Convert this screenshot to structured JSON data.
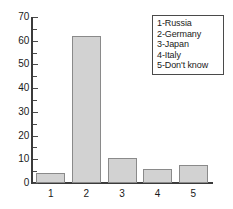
{
  "chart_data": {
    "type": "bar",
    "title": "",
    "xlabel": "",
    "ylabel": "",
    "categories": [
      "1",
      "2",
      "3",
      "4",
      "5"
    ],
    "values": [
      4.2,
      62,
      10.5,
      6,
      7.5
    ],
    "ylim": [
      0,
      70
    ],
    "ytick_labels": [
      "0",
      "10",
      "20",
      "30",
      "40",
      "50",
      "60",
      "70"
    ],
    "ytick_values": [
      0,
      10,
      20,
      30,
      40,
      50,
      60,
      70
    ],
    "yminor_values": [
      5,
      15,
      25,
      35,
      45,
      55,
      65
    ],
    "grid": false,
    "legend_position": "top-right",
    "legend": [
      "1-Russia",
      "2-Germany",
      "3-Japan",
      "4-Italy",
      "5-Don't know"
    ],
    "colors": {
      "bar_fill": "#d2d2d2",
      "bar_border": "#8a8a8a",
      "axis": "#3b3b3b",
      "text": "#1a1a1a",
      "background": "#ffffff"
    }
  }
}
